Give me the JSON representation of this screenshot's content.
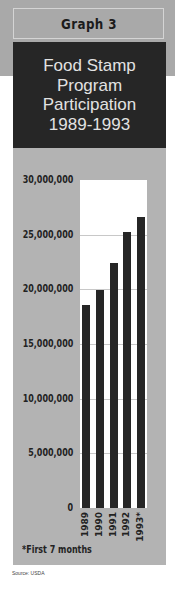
{
  "header": {
    "graph_label": "Graph 3",
    "title_lines": [
      "Food Stamp",
      "Program",
      "Participation",
      "1989-1993"
    ]
  },
  "footnote": "*First 7 months",
  "source": "Source: USDA",
  "colors": {
    "panel_bg": "#b3b3b3",
    "title_bg": "#262626",
    "title_text": "#e2e2e2",
    "bar": "#262626",
    "plot_bg": "#ffffff"
  },
  "chart_data": {
    "type": "bar",
    "title": "Food Stamp Program Participation 1989-1993",
    "subtitle": "Graph 3",
    "categories": [
      "1989",
      "1990",
      "1991",
      "1992",
      "1993*"
    ],
    "values": [
      18600000,
      19900000,
      22400000,
      25200000,
      26600000
    ],
    "xlabel": "",
    "ylabel": "",
    "ylim": [
      0,
      30000000
    ],
    "yticks": [
      0,
      5000000,
      10000000,
      15000000,
      20000000,
      25000000,
      30000000
    ],
    "ytick_labels": [
      "0",
      "5,000,000",
      "10,000,000",
      "15,000,000",
      "20,000,000",
      "25,000,000",
      "30,000,000"
    ],
    "grid": true,
    "legend": null,
    "annotations": [
      "*First 7 months"
    ],
    "source": "Source: USDA"
  }
}
